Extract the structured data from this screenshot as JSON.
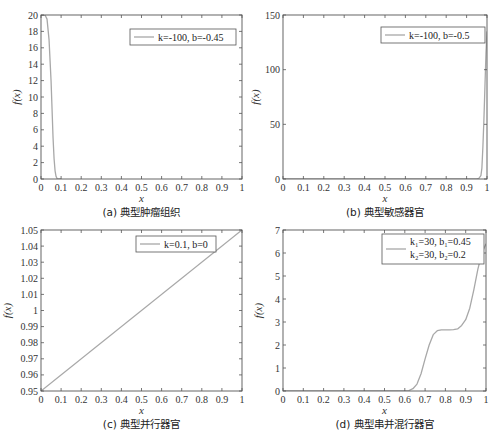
{
  "chart_data": [
    {
      "id": "a",
      "type": "line",
      "caption": "(a)  典型肿瘤组织",
      "xlabel": "x",
      "ylabel": "f(x)",
      "xlim": [
        0,
        1
      ],
      "ylim": [
        0,
        20
      ],
      "xticks": [
        "0",
        "0.1",
        "0.2",
        "0.3",
        "0.4",
        "0.5",
        "0.6",
        "0.7",
        "0.8",
        "0.9",
        "1"
      ],
      "yticks": [
        "0",
        "2",
        "4",
        "6",
        "8",
        "10",
        "12",
        "14",
        "16",
        "18",
        "20"
      ],
      "grid": false,
      "legend": [
        "k=-100,  b=-0.45"
      ],
      "legend_position": "upper right",
      "box": {
        "left": 41,
        "top": 15,
        "right": 242,
        "bottom": 179
      },
      "legend_box": {
        "left": 130,
        "top": 29,
        "width": 106,
        "height": 16
      },
      "series": [
        {
          "name": "k=-100, b=-0.45",
          "x": [
            0,
            0.02,
            0.03,
            0.04,
            0.05,
            0.055,
            0.06,
            0.065,
            0.07,
            0.075,
            0.08,
            0.09,
            0.1
          ],
          "y": [
            20,
            20,
            19.5,
            17,
            12,
            8.5,
            5,
            2.5,
            1,
            0.3,
            0.05,
            0,
            0
          ]
        }
      ]
    },
    {
      "id": "b",
      "type": "line",
      "caption": "(b)  典型敏感器官",
      "xlabel": "x",
      "ylabel": "f(x)",
      "xlim": [
        0,
        1
      ],
      "ylim": [
        0,
        150
      ],
      "xticks": [
        "0",
        "0.1",
        "0.2",
        "0.3",
        "0.4",
        "0.5",
        "0.6",
        "0.7",
        "0.8",
        "0.9",
        "1"
      ],
      "yticks": [
        "0",
        "50",
        "100",
        "150"
      ],
      "grid": false,
      "legend": [
        "k=-100,  b=-0.5"
      ],
      "legend_position": "upper right",
      "box": {
        "left": 283,
        "top": 15,
        "right": 487,
        "bottom": 179
      },
      "legend_box": {
        "left": 381,
        "top": 27,
        "width": 104,
        "height": 16
      },
      "series": [
        {
          "name": "k=-100, b=-0.5",
          "x": [
            0,
            0.95,
            0.96,
            0.97,
            0.975,
            0.98,
            0.985,
            0.99,
            0.995,
            1.0
          ],
          "y": [
            0,
            0,
            0.5,
            3,
            10,
            30,
            55,
            85,
            115,
            135
          ]
        }
      ]
    },
    {
      "id": "c",
      "type": "line",
      "caption": "(c)  典型并行器官",
      "xlabel": "x",
      "ylabel": "f(x)",
      "xlim": [
        0,
        1
      ],
      "ylim": [
        0.95,
        1.05
      ],
      "xticks": [
        "0",
        "0.1",
        "0.2",
        "0.3",
        "0.4",
        "0.5",
        "0.6",
        "0.7",
        "0.8",
        "0.9",
        "1"
      ],
      "yticks": [
        "0.95",
        "0.96",
        "0.97",
        "0.98",
        "0.99",
        "1",
        "1.01",
        "1.02",
        "1.03",
        "1.04",
        "1.05"
      ],
      "grid": false,
      "legend": [
        "k=0.1,  b=0"
      ],
      "legend_position": "upper right",
      "box": {
        "left": 41,
        "top": 230,
        "right": 242,
        "bottom": 391
      },
      "legend_box": {
        "left": 136,
        "top": 236,
        "width": 80,
        "height": 16
      },
      "series": [
        {
          "name": "k=0.1, b=0",
          "x": [
            0,
            1
          ],
          "y": [
            0.95,
            1.05
          ]
        }
      ]
    },
    {
      "id": "d",
      "type": "line",
      "caption": "(d)  典型串并混行器官",
      "xlabel": "x",
      "ylabel": "f(x)",
      "xlim": [
        0,
        1
      ],
      "ylim": [
        0,
        7
      ],
      "xticks": [
        "0",
        "0.1",
        "0.2",
        "0.3",
        "0.4",
        "0.5",
        "0.6",
        "0.7",
        "0.8",
        "0.9",
        "1"
      ],
      "yticks": [
        "0",
        "1",
        "2",
        "3",
        "4",
        "5",
        "6",
        "7"
      ],
      "grid": false,
      "legend": [
        "k₁=30,  b₁=0.45",
        "k₂=30,  b₂=0.2"
      ],
      "legend_position": "upper right",
      "box": {
        "left": 283,
        "top": 230,
        "right": 486,
        "bottom": 391
      },
      "legend_box": {
        "left": 382,
        "top": 234,
        "width": 102,
        "height": 30
      },
      "series": [
        {
          "name": "k1=30, b1=0.45; k2=30, b2=0.2",
          "x": [
            0,
            0.6,
            0.62,
            0.64,
            0.66,
            0.68,
            0.7,
            0.72,
            0.74,
            0.76,
            0.78,
            0.8,
            0.82,
            0.84,
            0.86,
            0.88,
            0.9,
            0.92,
            0.94,
            0.96,
            0.98,
            1.0
          ],
          "y": [
            0,
            0,
            0.02,
            0.1,
            0.3,
            0.75,
            1.4,
            2.0,
            2.45,
            2.62,
            2.66,
            2.66,
            2.66,
            2.67,
            2.7,
            2.85,
            3.1,
            3.6,
            4.4,
            5.3,
            6.0,
            6.4
          ]
        }
      ]
    }
  ],
  "style": {
    "line_color": "#a8a8a8",
    "axis_color": "#555555",
    "text_color": "#333333",
    "background": "#ffffff"
  }
}
